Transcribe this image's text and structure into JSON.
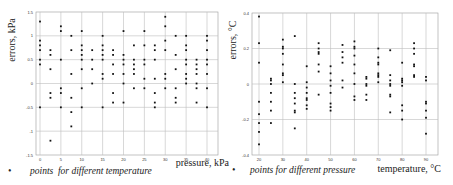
{
  "chart_data": [
    {
      "type": "scatter",
      "title": "",
      "xlabel": "pressure, kPa",
      "ylabel": "errors, kPa",
      "xlim": [
        -2,
        42
      ],
      "ylim": [
        -1.5,
        1.5
      ],
      "xticks": [
        0,
        5,
        10,
        15,
        20,
        25,
        30,
        35,
        40
      ],
      "yticks": [
        -1.5,
        -1,
        -0.5,
        0,
        0.5,
        1,
        1.5
      ],
      "grid": true,
      "legend": "points  for different temperature",
      "points": [
        [
          0,
          1.3
        ],
        [
          0,
          0.9
        ],
        [
          0,
          0.8
        ],
        [
          0,
          0.7
        ],
        [
          0,
          0.5
        ],
        [
          0,
          0.4
        ],
        [
          0,
          -0.5
        ],
        [
          2.5,
          0.7
        ],
        [
          2.5,
          0.6
        ],
        [
          2.5,
          0.3
        ],
        [
          2.5,
          -0.2
        ],
        [
          2.5,
          -0.3
        ],
        [
          2.5,
          -1.2
        ],
        [
          5,
          1.2
        ],
        [
          5,
          1.1
        ],
        [
          5,
          0.5
        ],
        [
          5,
          -0.1
        ],
        [
          5,
          -0.2
        ],
        [
          5,
          -0.5
        ],
        [
          7.5,
          1.0
        ],
        [
          7.5,
          0.7
        ],
        [
          7.5,
          0.2
        ],
        [
          7.5,
          -0.3
        ],
        [
          7.5,
          -0.6
        ],
        [
          7.5,
          -0.9
        ],
        [
          10,
          1.1
        ],
        [
          10,
          0.8
        ],
        [
          10,
          0.7
        ],
        [
          10,
          0.6
        ],
        [
          10,
          0.5
        ],
        [
          10,
          0.3
        ],
        [
          10,
          -0.1
        ],
        [
          10,
          -0.5
        ],
        [
          12.5,
          0.7
        ],
        [
          12.5,
          0.5
        ],
        [
          12.5,
          0.3
        ],
        [
          12.5,
          0.0
        ],
        [
          15,
          1.0
        ],
        [
          15,
          0.8
        ],
        [
          15,
          0.7
        ],
        [
          15,
          0.6
        ],
        [
          15,
          0.5
        ],
        [
          15,
          0.2
        ],
        [
          15,
          0.1
        ],
        [
          15,
          -0.5
        ],
        [
          17.5,
          0.7
        ],
        [
          17.5,
          0.6
        ],
        [
          17.5,
          0.4
        ],
        [
          17.5,
          0.2
        ],
        [
          17.5,
          -0.2
        ],
        [
          17.5,
          -0.4
        ],
        [
          20,
          1.1
        ],
        [
          20,
          0.6
        ],
        [
          20,
          0.5
        ],
        [
          20,
          0.4
        ],
        [
          20,
          0.2
        ],
        [
          20,
          0.0
        ],
        [
          20,
          -0.4
        ],
        [
          22.5,
          0.8
        ],
        [
          22.5,
          0.5
        ],
        [
          22.5,
          0.4
        ],
        [
          22.5,
          0.3
        ],
        [
          22.5,
          0.2
        ],
        [
          22.5,
          -0.1
        ],
        [
          25,
          1.1
        ],
        [
          25,
          0.8
        ],
        [
          25,
          0.5
        ],
        [
          25,
          0.4
        ],
        [
          25,
          0.1
        ],
        [
          25,
          -0.1
        ],
        [
          27.5,
          0.8
        ],
        [
          27.5,
          0.7
        ],
        [
          27.5,
          0.5
        ],
        [
          27.5,
          0.1
        ],
        [
          27.5,
          -0.2
        ],
        [
          27.5,
          -0.4
        ],
        [
          27.5,
          -0.5
        ],
        [
          30,
          1.4
        ],
        [
          30,
          1.2
        ],
        [
          30,
          0.9
        ],
        [
          30,
          0.7
        ],
        [
          30,
          0.2
        ],
        [
          30,
          0.1
        ],
        [
          30,
          -0.1
        ],
        [
          32.5,
          1.0
        ],
        [
          32.5,
          0.6
        ],
        [
          32.5,
          0.3
        ],
        [
          32.5,
          -0.1
        ],
        [
          32.5,
          -0.3
        ],
        [
          32.5,
          -0.4
        ],
        [
          35,
          1.0
        ],
        [
          35,
          0.8
        ],
        [
          35,
          0.7
        ],
        [
          35,
          0.5
        ],
        [
          35,
          0.4
        ],
        [
          35,
          0.2
        ],
        [
          35,
          0.1
        ],
        [
          35,
          0.0
        ],
        [
          37.5,
          0.5
        ],
        [
          37.5,
          0.4
        ],
        [
          37.5,
          0.3
        ],
        [
          37.5,
          0.2
        ],
        [
          37.5,
          0.0
        ],
        [
          37.5,
          -0.1
        ],
        [
          37.5,
          -0.4
        ],
        [
          40,
          1.0
        ],
        [
          40,
          0.9
        ],
        [
          40,
          0.7
        ],
        [
          40,
          0.5
        ],
        [
          40,
          0.4
        ],
        [
          40,
          0.2
        ],
        [
          40,
          -0.1
        ],
        [
          40,
          -0.5
        ]
      ]
    },
    {
      "type": "scatter",
      "title": "",
      "xlabel": "temperature, °C",
      "ylabel": "errors, °C",
      "xlim": [
        16,
        94
      ],
      "ylim": [
        -0.4,
        0.4
      ],
      "xticks": [
        20,
        30,
        40,
        50,
        60,
        70,
        80,
        90
      ],
      "yticks": [
        -0.4,
        -0.2,
        0,
        0.2,
        0.4
      ],
      "grid": true,
      "legend": "points for different pressure",
      "points": [
        [
          20,
          0.38
        ],
        [
          20,
          0.23
        ],
        [
          20,
          0.12
        ],
        [
          20,
          -0.1
        ],
        [
          20,
          -0.17
        ],
        [
          20,
          -0.22
        ],
        [
          20,
          -0.27
        ],
        [
          20,
          -0.34
        ],
        [
          25,
          0.03
        ],
        [
          25,
          0.02
        ],
        [
          25,
          0.0
        ],
        [
          25,
          -0.05
        ],
        [
          25,
          -0.1
        ],
        [
          25,
          -0.15
        ],
        [
          25,
          -0.22
        ],
        [
          30,
          0.25
        ],
        [
          30,
          0.21
        ],
        [
          30,
          0.2
        ],
        [
          30,
          0.17
        ],
        [
          30,
          0.11
        ],
        [
          30,
          0.06
        ],
        [
          30,
          0.05
        ],
        [
          30,
          0.01
        ],
        [
          35,
          0.27
        ],
        [
          35,
          0.0
        ],
        [
          35,
          -0.05
        ],
        [
          35,
          -0.08
        ],
        [
          35,
          -0.11
        ],
        [
          35,
          -0.15
        ],
        [
          35,
          -0.16
        ],
        [
          35,
          -0.25
        ],
        [
          40,
          0.1
        ],
        [
          40,
          0.01
        ],
        [
          40,
          -0.02
        ],
        [
          40,
          -0.05
        ],
        [
          40,
          -0.08
        ],
        [
          40,
          -0.09
        ],
        [
          40,
          -0.12
        ],
        [
          40,
          -0.14
        ],
        [
          45,
          0.23
        ],
        [
          45,
          0.2
        ],
        [
          45,
          0.18
        ],
        [
          45,
          0.17
        ],
        [
          45,
          0.11
        ],
        [
          45,
          0.07
        ],
        [
          45,
          -0.06
        ],
        [
          50,
          0.1
        ],
        [
          50,
          0.06
        ],
        [
          50,
          0.02
        ],
        [
          50,
          -0.01
        ],
        [
          50,
          -0.05
        ],
        [
          50,
          -0.11
        ],
        [
          50,
          -0.13
        ],
        [
          50,
          -0.15
        ],
        [
          55,
          0.22
        ],
        [
          55,
          0.18
        ],
        [
          55,
          0.15
        ],
        [
          55,
          0.12
        ],
        [
          55,
          0.02
        ],
        [
          55,
          -0.02
        ],
        [
          60,
          0.24
        ],
        [
          60,
          0.21
        ],
        [
          60,
          0.2
        ],
        [
          60,
          0.16
        ],
        [
          60,
          0.11
        ],
        [
          60,
          0.06
        ],
        [
          60,
          0.0
        ],
        [
          60,
          -0.07
        ],
        [
          60,
          -0.09
        ],
        [
          65,
          0.04
        ],
        [
          65,
          0.03
        ],
        [
          65,
          0.0
        ],
        [
          65,
          -0.01
        ],
        [
          65,
          -0.06
        ],
        [
          65,
          -0.09
        ],
        [
          70,
          0.2
        ],
        [
          70,
          0.15
        ],
        [
          70,
          0.12
        ],
        [
          70,
          0.11
        ],
        [
          70,
          0.06
        ],
        [
          70,
          0.05
        ],
        [
          70,
          0.04
        ],
        [
          70,
          0.01
        ],
        [
          75,
          0.19
        ],
        [
          75,
          0.05
        ],
        [
          75,
          0.02
        ],
        [
          75,
          0.0
        ],
        [
          75,
          -0.01
        ],
        [
          75,
          -0.06
        ],
        [
          75,
          -0.07
        ],
        [
          75,
          -0.16
        ],
        [
          80,
          0.12
        ],
        [
          80,
          0.03
        ],
        [
          80,
          0.02
        ],
        [
          80,
          0.01
        ],
        [
          80,
          -0.01
        ],
        [
          80,
          -0.12
        ],
        [
          80,
          -0.15
        ],
        [
          80,
          -0.2
        ],
        [
          85,
          0.23
        ],
        [
          85,
          0.2
        ],
        [
          85,
          0.17
        ],
        [
          85,
          0.11
        ],
        [
          85,
          0.1
        ],
        [
          85,
          0.05
        ],
        [
          85,
          0.04
        ],
        [
          90,
          0.04
        ],
        [
          90,
          0.02
        ],
        [
          90,
          -0.1
        ],
        [
          90,
          -0.11
        ],
        [
          90,
          -0.15
        ],
        [
          90,
          -0.19
        ],
        [
          90,
          -0.28
        ]
      ]
    }
  ],
  "charts": {
    "left": {
      "ylabel": "errors, kPa",
      "xlabel": "pressure, kPa",
      "legend_marker": "•",
      "legend": "points  for different temperature",
      "yticklabels": [
        "1.5",
        "1",
        "0.5",
        "0",
        "-0.5",
        "-1",
        "-1.5"
      ],
      "xticklabels": [
        "0",
        "5",
        "10",
        "15",
        "20",
        "25",
        "30",
        "35",
        "40"
      ]
    },
    "right": {
      "ylabel": "errors, °C",
      "xlabel": "temperature, °C",
      "legend_marker": "•",
      "legend": "points for different pressure",
      "yticklabels": [
        "0.4",
        "0.2",
        "0",
        "-0.2",
        "-0.4"
      ],
      "xticklabels": [
        "20",
        "30",
        "40",
        "50",
        "60",
        "70",
        "80",
        "90"
      ]
    }
  },
  "colors": {
    "grid": "#bdbdbd",
    "frame": "#9a9a9a",
    "point": "#111111",
    "text": "#222222"
  }
}
